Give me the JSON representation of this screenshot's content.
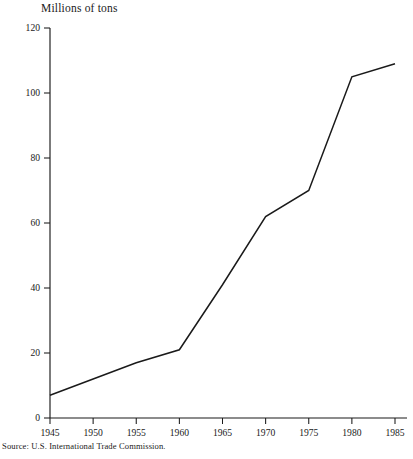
{
  "chart_data": {
    "type": "line",
    "title": "",
    "ylabel": "Millions of tons",
    "xlabel": "",
    "x": [
      1945,
      1950,
      1955,
      1960,
      1965,
      1970,
      1975,
      1980,
      1985
    ],
    "series": [
      {
        "name": "Millions of tons",
        "values": [
          7,
          12,
          17,
          21,
          41,
          62,
          70,
          105,
          109
        ]
      }
    ],
    "xlim": [
      1945,
      1985
    ],
    "ylim": [
      0,
      120
    ],
    "xticks": [
      1945,
      1950,
      1955,
      1960,
      1965,
      1970,
      1975,
      1980,
      1985
    ],
    "xtick_labels": [
      "1945",
      "1950",
      "1955",
      "1960",
      "1965",
      "1970",
      "1975",
      "1980",
      "1985"
    ],
    "yticks": [
      0,
      20,
      40,
      60,
      80,
      100,
      120
    ],
    "ytick_labels": [
      "0",
      "20",
      "40",
      "60",
      "80",
      "100",
      "120"
    ],
    "grid": false,
    "legend": "none",
    "line_color": "#1a1a1a",
    "vertices": [
      {
        "x": 1945,
        "y": 7
      },
      {
        "x": 1950,
        "y": 12
      },
      {
        "x": 1955,
        "y": 17
      },
      {
        "x": 1960,
        "y": 21
      },
      {
        "x": 1965,
        "y": 41
      },
      {
        "x": 1970,
        "y": 62
      },
      {
        "x": 1975,
        "y": 70
      },
      {
        "x": 1980,
        "y": 105
      },
      {
        "x": 1985,
        "y": 109
      }
    ]
  },
  "figure": {
    "axis_title": "Millions of tons",
    "source_note": "Source: U.S. International Trade Commission."
  }
}
